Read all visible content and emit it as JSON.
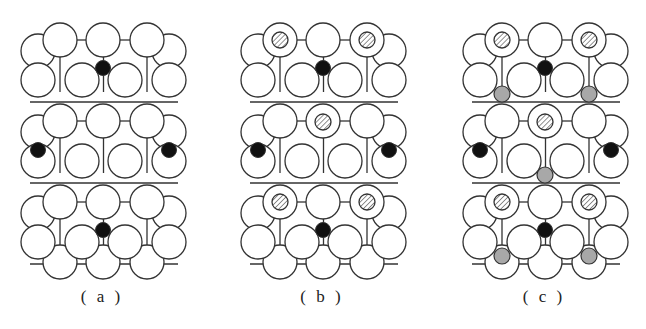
{
  "figure": {
    "panels": [
      {
        "id": "a",
        "caption": "( a )",
        "offset_x": 0,
        "hatched_adsorbates": [],
        "gray_adsorbates": []
      },
      {
        "id": "b",
        "caption": "( b )",
        "offset_x": 220,
        "hatched_adsorbates": [
          [
            60,
            40
          ],
          [
            147,
            40
          ],
          [
            103,
            122
          ],
          [
            60,
            202
          ],
          [
            147,
            202
          ]
        ],
        "gray_adsorbates": []
      },
      {
        "id": "c",
        "caption": "( c )",
        "offset_x": 442,
        "hatched_adsorbates": [
          [
            60,
            40
          ],
          [
            147,
            40
          ],
          [
            103,
            122
          ],
          [
            60,
            202
          ],
          [
            147,
            202
          ]
        ],
        "gray_adsorbates": [
          [
            60,
            94
          ],
          [
            147,
            94
          ],
          [
            103,
            175
          ],
          [
            60,
            256
          ],
          [
            147,
            256
          ]
        ]
      }
    ],
    "lattice": {
      "block_tops_y": [
        40,
        121,
        202
      ],
      "front_row_x": [
        60,
        103,
        147
      ],
      "second_row_x": [
        38,
        82,
        125,
        169
      ],
      "back_side_x": [
        38,
        169
      ],
      "bottom_row_x": [
        60,
        103,
        147
      ],
      "bottom_row_y": 262,
      "large_radius": 17,
      "black_atoms": [
        [
          103,
          68
        ],
        [
          38,
          150
        ],
        [
          169,
          150
        ],
        [
          103,
          230
        ]
      ]
    },
    "colors": {
      "outline": "#333333",
      "black_atom": "#111111",
      "gray_atom": "#a8a8a8",
      "hatch": "#777777"
    },
    "legend": {
      "large_circle": "substrate atom",
      "black_circle": "subsurface atom",
      "hatched_circle": "adsorbate A",
      "gray_circle": "adsorbate B"
    }
  }
}
